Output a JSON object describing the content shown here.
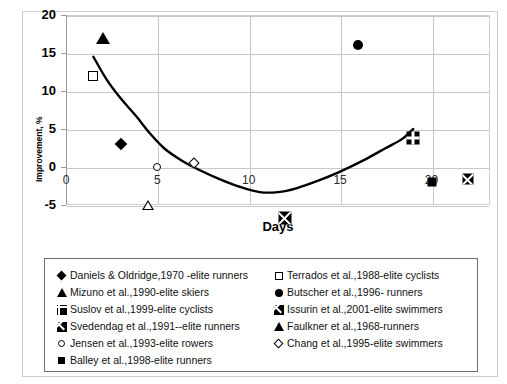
{
  "chart_data": {
    "type": "scatter",
    "title": "",
    "xlabel": "Days",
    "ylabel": "Improvement, %",
    "xlim": [
      0,
      23.2
    ],
    "ylim": [
      -5,
      20
    ],
    "xticks": [
      0,
      5,
      10,
      15,
      20
    ],
    "yticks": [
      20,
      15,
      10,
      5,
      0,
      -5
    ],
    "grid": true,
    "legend_position": "below-plot",
    "series": [
      {
        "name": "Daniels & Oldridge,1970 -elite runners",
        "marker": "filled-diamond",
        "x": 3,
        "y": 3.0
      },
      {
        "name": "Mizuno et al.,1990-elite skiers",
        "marker": "filled-triangle",
        "x": 2,
        "y": 17.0
      },
      {
        "name": "Suslov et al.,1999-elite cyclists",
        "marker": "plus-in-square",
        "x": 19,
        "y": 3.8
      },
      {
        "name": "Svedendag et al.,1991--elite runners",
        "marker": "x-in-square",
        "x": 12,
        "y": -5.0
      },
      {
        "name": "Jensen et al.,1993-elite rowers",
        "marker": "open-circle",
        "x": 5,
        "y": 0.0
      },
      {
        "name": "Balley et al.,1998-elite runners",
        "marker": "filled-square",
        "x": 20,
        "y": -2.0
      },
      {
        "name": "Terrados et al.,1988-elite cyclists",
        "marker": "open-square",
        "x": 1.5,
        "y": 12.0
      },
      {
        "name": "Butscher et al.,1996- runners",
        "marker": "filled-circle",
        "x": 16,
        "y": 16.0
      },
      {
        "name": "Issurin et al.,2001-elite swimmers",
        "marker": "x-in-square",
        "x": 22,
        "y": 1.8
      },
      {
        "name": "Faulkner et al.,1968-runners",
        "marker": "open-triangle",
        "x": 4.5,
        "y": -0.1
      },
      {
        "name": "Chang et al.,1995-elite swimmers",
        "marker": "open-diamond",
        "x": 7,
        "y": 0.5
      }
    ],
    "trendline": {
      "name": "fitted-trend-curve",
      "points": [
        [
          1.5,
          14.5
        ],
        [
          2.2,
          11.6
        ],
        [
          3.0,
          9.0
        ],
        [
          3.8,
          6.8
        ],
        [
          4.6,
          4.4
        ],
        [
          5.4,
          2.4
        ],
        [
          6.3,
          0.9
        ],
        [
          7.3,
          -0.4
        ],
        [
          8.4,
          -1.6
        ],
        [
          9.5,
          -2.6
        ],
        [
          10.6,
          -3.3
        ],
        [
          11.6,
          -3.3
        ],
        [
          12.6,
          -2.8
        ],
        [
          13.8,
          -1.8
        ],
        [
          15.0,
          -0.6
        ],
        [
          16.3,
          0.9
        ],
        [
          17.5,
          2.5
        ],
        [
          18.4,
          3.7
        ],
        [
          19.0,
          5.0
        ]
      ]
    }
  },
  "axis": {
    "y_title": "Improvement, %",
    "x_title": "Days",
    "y_tick_labels": [
      "20",
      "15",
      "10",
      "5",
      "0",
      "-5"
    ],
    "x_tick_labels": [
      "0",
      "5",
      "10",
      "15",
      "20"
    ]
  },
  "legend": {
    "left_column": [
      {
        "marker": "filled-diamond",
        "label": "Daniels & Oldridge,1970 -elite runners"
      },
      {
        "marker": "filled-triangle",
        "label": "Mizuno et al.,1990-elite skiers"
      },
      {
        "marker": "plus-in-square",
        "label": "Suslov et al.,1999-elite cyclists"
      },
      {
        "marker": "x-in-square",
        "label": "Svedendag et al.,1991--elite runners"
      },
      {
        "marker": "open-circle",
        "label": "Jensen et al.,1993-elite rowers"
      },
      {
        "marker": "filled-square",
        "label": "Balley et al.,1998-elite runners"
      }
    ],
    "right_column": [
      {
        "marker": "open-square",
        "label": "Terrados et al.,1988-elite cyclists"
      },
      {
        "marker": "filled-circle",
        "label": "Butscher et al.,1996- runners"
      },
      {
        "marker": "x-in-square",
        "label": "Issurin et al.,2001-elite swimmers"
      },
      {
        "marker": "open-triangle",
        "label": "Faulkner et al.,1968-runners"
      },
      {
        "marker": "open-diamond",
        "label": "Chang et al.,1995-elite swimmers"
      }
    ]
  },
  "colors": {
    "marker": "#000000",
    "gridline": "#c8c8c8",
    "axis": "#9a9a9a",
    "frame": "#cfcfcf",
    "legend_border": "#6e6e6e",
    "background": "#ffffff"
  }
}
